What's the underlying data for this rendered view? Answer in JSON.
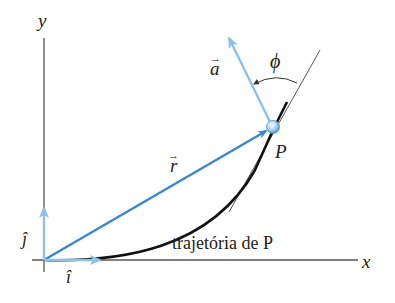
{
  "diagram": {
    "axes": {
      "x_label": "x",
      "y_label": "y"
    },
    "unit_vectors": {
      "i_label": "î",
      "j_label": "ĵ"
    },
    "position_vector": {
      "label": "r",
      "arrow": "→"
    },
    "acceleration_vector": {
      "label": "a",
      "arrow": "→"
    },
    "angle": {
      "label": "ϕ"
    },
    "point": {
      "label": "P"
    },
    "path": {
      "label": "trajetória de P"
    },
    "colors": {
      "vector_blue": "#3b86d0",
      "light_blue": "#8ec0ea",
      "curve": "#111111",
      "axis": "#555555"
    }
  }
}
